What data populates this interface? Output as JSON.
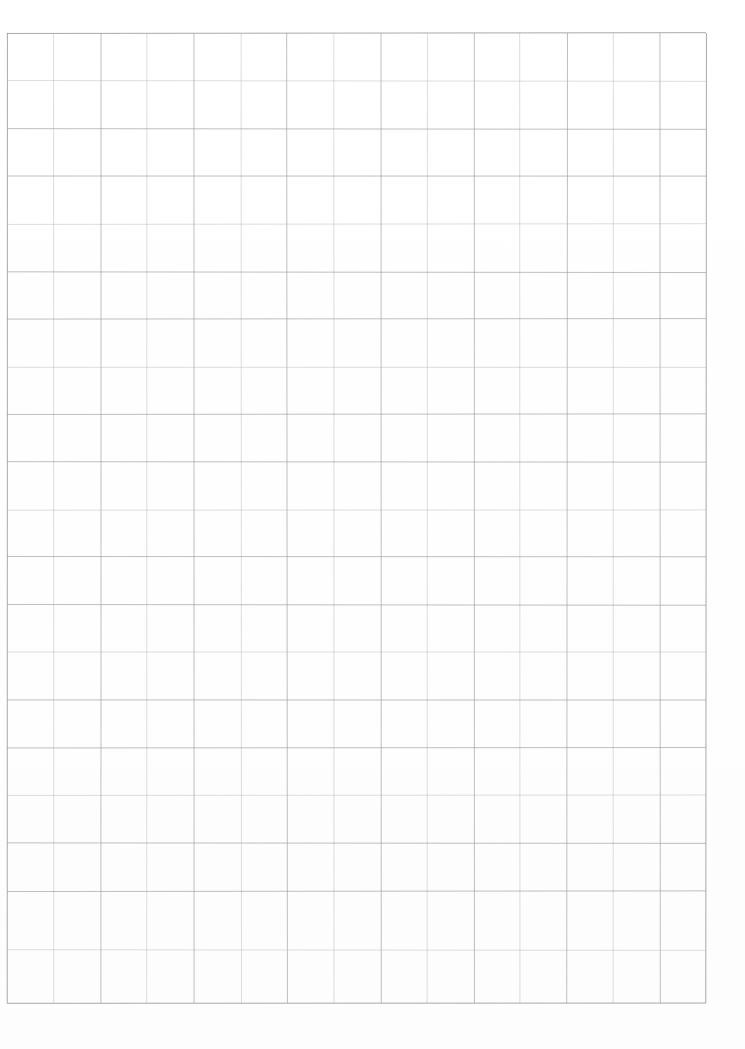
{
  "document": {
    "kind": "scanned-blank-grid-sheet",
    "title": "Blank Grid Sheet",
    "page_width": 745,
    "page_height": 1049,
    "background_color": "#ffffff",
    "has_text": false,
    "has_header": false,
    "has_footer": false,
    "page_number_text": "",
    "margin_note_text": ""
  },
  "grid": {
    "line_color": "#9a9a9a",
    "line_color_soft": "#b4b4b4",
    "line_width": 0.75,
    "columns": 15,
    "rows": 20,
    "left": 7,
    "top": 33,
    "right": 706,
    "bottom": 1003,
    "width": 699,
    "height": 970,
    "cell_width": 46.6,
    "cell_height": 48.5,
    "x_positions": [
      7,
      54,
      101,
      147,
      194,
      241,
      287,
      334,
      381,
      427,
      474,
      520,
      567,
      613,
      660,
      706
    ],
    "y_positions": [
      33,
      81,
      129,
      176,
      224,
      272,
      319,
      367,
      414,
      462,
      510,
      557,
      605,
      652,
      700,
      748,
      795,
      843,
      891,
      950,
      1003
    ]
  },
  "margins": {
    "top_margin_px": 33,
    "left_margin_px": 7,
    "right_margin_px": 39,
    "bottom_margin_px": 46
  }
}
